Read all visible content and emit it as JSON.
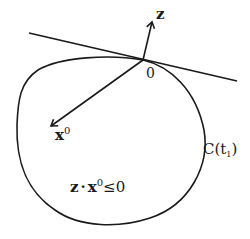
{
  "diagram": {
    "labels": {
      "z_vector": "z",
      "origin": "0",
      "x0_vector_base": "x",
      "x0_vector_sup": "0",
      "curve_name": "C(t",
      "curve_sub": "1",
      "curve_close": ")",
      "inequality_z": "z",
      "inequality_dot": "·",
      "inequality_x": "x",
      "inequality_sup": "0",
      "inequality_rel": "≤0"
    },
    "colors": {
      "stroke": "#1a1a1a",
      "background": "#ffffff"
    }
  }
}
